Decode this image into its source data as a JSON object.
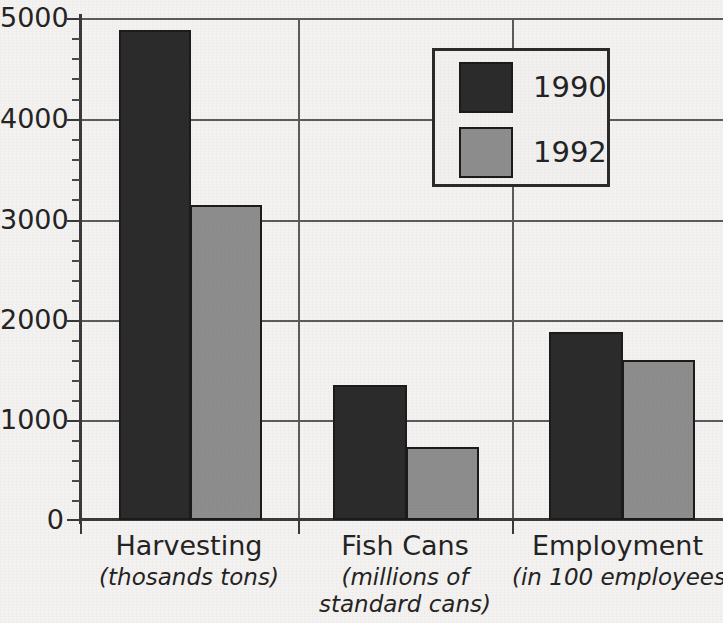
{
  "chart_data": {
    "type": "bar",
    "title": "",
    "xlabel": "",
    "ylabel": "",
    "ylim": [
      0,
      5000
    ],
    "grid": true,
    "legend_position": "top-right",
    "categories": [
      "Harvesting",
      "Fish Cans",
      "Employment"
    ],
    "category_sublabels": [
      [
        "(thosands tons)"
      ],
      [
        "(millions of",
        "standard cans)"
      ],
      [
        "(in 100 employees)"
      ]
    ],
    "series": [
      {
        "name": "1990",
        "color": "#2b2b2b",
        "values": [
          4880,
          1340,
          1870
        ]
      },
      {
        "name": "1992",
        "color": "#8d8d8d",
        "values": [
          3140,
          730,
          1590
        ]
      }
    ],
    "y_ticks": [
      {
        "value": 5000,
        "label": "5000"
      },
      {
        "value": 4000,
        "label": "4000"
      },
      {
        "value": 3000,
        "label": "3000"
      },
      {
        "value": 2000,
        "label": "2000"
      },
      {
        "value": 1000,
        "label": "1000"
      },
      {
        "value": 0,
        "label": "0"
      }
    ],
    "y_minor_tick_step": 200
  },
  "legend": {
    "entries": [
      {
        "label": "1990",
        "color": "#2b2b2b"
      },
      {
        "label": "1992",
        "color": "#8d8d8d"
      }
    ]
  },
  "axis_labels": {
    "y_5000": "5000",
    "y_4000": "4000",
    "y_3000": "3000",
    "y_2000": "2000",
    "y_1000": "1000",
    "y_0": "0"
  },
  "categories": {
    "harvesting": {
      "name": "Harvesting",
      "sub1": "(thosands tons)",
      "sub2": ""
    },
    "fish_cans": {
      "name": "Fish Cans",
      "sub1": "(millions of",
      "sub2": "standard cans)"
    },
    "employment": {
      "name": "Employment",
      "sub1": "(in 100 employees)",
      "sub2": ""
    }
  }
}
